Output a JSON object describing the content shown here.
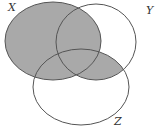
{
  "diagram": {
    "type": "venn",
    "sets": [
      {
        "name": "X"
      },
      {
        "name": "Y"
      },
      {
        "name": "Z"
      }
    ],
    "shaded_region": "X ∪ (Y ∩ Z)",
    "colors": {
      "shade": "#a9a9a9",
      "stroke": "#555555",
      "background": "#ffffff"
    }
  }
}
